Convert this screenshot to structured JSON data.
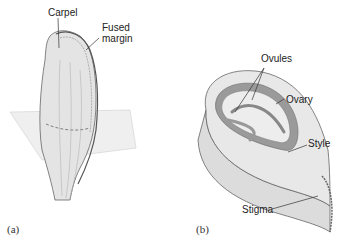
{
  "figure": {
    "panel_a": {
      "label": "(a)",
      "callouts": {
        "carpel": "Carpel",
        "fused_margin_line1": "Fused",
        "fused_margin_line2": "margin"
      }
    },
    "panel_b": {
      "label": "(b)",
      "callouts": {
        "ovules": "Ovules",
        "ovary": "Ovary",
        "style": "Style",
        "stigma": "Stigma"
      }
    },
    "colors": {
      "tissue": "#e6e6e6",
      "tissue_dark": "#9a9a9a",
      "outline": "#6a6a6a",
      "plane": "#eeeeee"
    }
  }
}
